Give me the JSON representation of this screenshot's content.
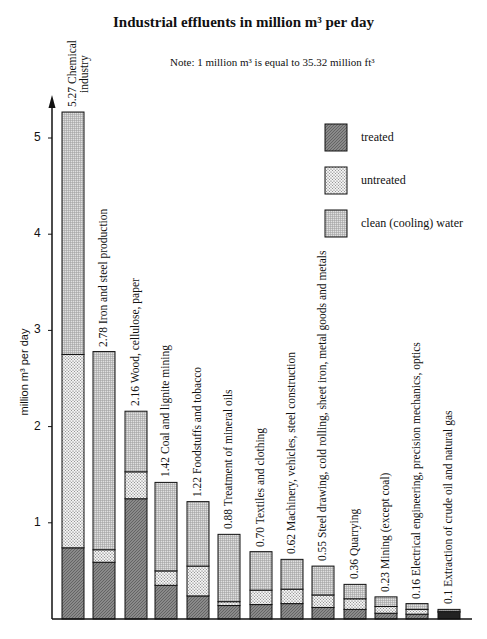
{
  "title": "Industrial effluents in million m³ per day",
  "note": "Note: 1 million m³ is equal to 35.32 million ft³",
  "legend": [
    {
      "key": "treated",
      "label": "treated"
    },
    {
      "key": "untreated",
      "label": "untreated"
    },
    {
      "key": "clean",
      "label": "clean (cooling) water"
    }
  ],
  "y_axis": {
    "label": "million m³ per day",
    "ticks": [
      "1",
      "2",
      "3",
      "4",
      "5"
    ]
  },
  "bar_labels": [
    "5.27  Chemical",
    "2.78  Iron and steel production",
    "2.16  Wood, cellulose, paper",
    "1.42  Coal and lignite mining",
    "1.22  Foodstuffs and tobacco",
    "0.88  Treatment of mineral oils",
    "0.70  Textiles and clothing",
    "0.62  Machinery, vehicles, steel construction",
    "0.55  Steel drawing, cold rolling, sheet iron, metal goods and metals",
    "0.36  Quarrying",
    "0.23  Mining (except coal)",
    "0.16  Electrical engineering, precision mechanics, optics",
    "0.1  Extraction of crude oil and natural gas"
  ],
  "bar_label_line2": [
    "industry"
  ],
  "colors": {
    "treated": "#7a7a7a",
    "untreated": "#e6e6e6",
    "clean": "#cfcfcf",
    "axis": "#111111"
  },
  "chart_data": {
    "type": "bar",
    "stacked": true,
    "orientation": "vertical",
    "title": "Industrial effluents in million m³ per day",
    "subtitle": "Note: 1 million m³ is equal to 35.32 million ft³",
    "xlabel": "",
    "ylabel": "million m³ per day",
    "ylim": [
      0,
      5.5
    ],
    "yticks": [
      1,
      2,
      3,
      4,
      5
    ],
    "grid": false,
    "legend_position": "upper right",
    "categories": [
      "Chemical industry",
      "Iron and steel production",
      "Wood, cellulose, paper",
      "Coal and lignite mining",
      "Foodstuffs and tobacco",
      "Treatment of mineral oils",
      "Textiles and clothing",
      "Machinery, vehicles, steel construction",
      "Steel drawing, cold rolling, sheet iron, metal goods and metals",
      "Quarrying",
      "Mining (except coal)",
      "Electrical engineering, precision mechanics, optics",
      "Extraction of crude oil and natural gas"
    ],
    "totals": [
      5.27,
      2.78,
      2.16,
      1.42,
      1.22,
      0.88,
      0.7,
      0.62,
      0.55,
      0.36,
      0.23,
      0.16,
      0.1
    ],
    "series": [
      {
        "name": "treated",
        "values": [
          0.74,
          0.59,
          1.25,
          0.35,
          0.24,
          0.14,
          0.15,
          0.16,
          0.12,
          0.1,
          0.06,
          0.05,
          0.07
        ]
      },
      {
        "name": "untreated",
        "values": [
          2.01,
          0.13,
          0.28,
          0.15,
          0.31,
          0.04,
          0.15,
          0.15,
          0.13,
          0.11,
          0.07,
          0.05,
          0.01
        ]
      },
      {
        "name": "clean (cooling) water",
        "values": [
          2.52,
          2.06,
          0.63,
          0.92,
          0.67,
          0.7,
          0.4,
          0.31,
          0.3,
          0.15,
          0.1,
          0.06,
          0.02
        ]
      }
    ]
  }
}
